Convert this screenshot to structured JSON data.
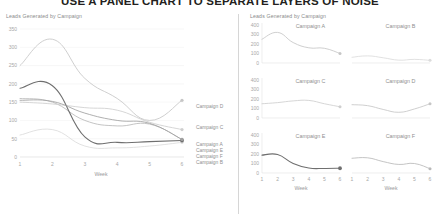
{
  "slide": {
    "title": "USE A PANEL CHART TO SEPARATE LAYERS OF NOISE"
  },
  "left": {
    "subtitle": "Leads Generated by Campaign",
    "xaxis_name": "Week",
    "yticks": [
      "0",
      "50",
      "100",
      "150",
      "200",
      "250",
      "300",
      "350"
    ],
    "xticks": [
      "1",
      "2",
      "3",
      "4",
      "5",
      "6"
    ],
    "legend": [
      {
        "label": "Campaign D"
      },
      {
        "label": "Campaign C"
      },
      {
        "label": "Campaign A"
      },
      {
        "label": "Campaign E"
      },
      {
        "label": "Campaign F"
      },
      {
        "label": "Campaign B"
      }
    ]
  },
  "right": {
    "subtitle": "Leads Generated by Campaign",
    "xaxis_name": "Week",
    "yticks": [
      "0",
      "100",
      "200",
      "300",
      "400"
    ],
    "xticks": [
      "1",
      "2",
      "3",
      "4",
      "5",
      "6"
    ],
    "panels": [
      {
        "label": "Campaign A"
      },
      {
        "label": "Campaign B"
      },
      {
        "label": "Campaign C"
      },
      {
        "label": "Campaign D"
      },
      {
        "label": "Campaign E"
      },
      {
        "label": "Campaign F"
      }
    ]
  },
  "chart_data": {
    "type": "line",
    "title": "Leads Generated by Campaign",
    "xlabel": "Week",
    "ylabel": "",
    "x": [
      1,
      2,
      3,
      4,
      5,
      6
    ],
    "xlim": [
      1,
      6
    ],
    "grid": false,
    "legend_position": "right",
    "overview": {
      "ylim": [
        0,
        350
      ],
      "yticks": [
        0,
        50,
        100,
        150,
        200,
        250,
        300,
        350
      ],
      "series": [
        {
          "name": "Campaign A",
          "values": [
            160,
            150,
            100,
            85,
            90,
            48
          ],
          "color": "#b9b9b9",
          "highlight": false
        },
        {
          "name": "Campaign B",
          "values": [
            60,
            75,
            30,
            25,
            30,
            40
          ],
          "color": "#dcdcdc",
          "highlight": false
        },
        {
          "name": "Campaign C",
          "values": [
            150,
            145,
            135,
            128,
            95,
            75
          ],
          "color": "#cfcfcf",
          "highlight": false
        },
        {
          "name": "Campaign D",
          "values": [
            250,
            322,
            215,
            160,
            100,
            155
          ],
          "color": "#c6c6c6",
          "highlight": false
        },
        {
          "name": "Campaign E",
          "values": [
            188,
            195,
            55,
            40,
            42,
            45
          ],
          "color": "#6f6f6f",
          "highlight": true
        },
        {
          "name": "Campaign F",
          "values": [
            155,
            152,
            120,
            100,
            92,
            48
          ],
          "color": "#a0a0a0",
          "highlight": false
        }
      ]
    },
    "panels": {
      "ylim": [
        0,
        400
      ],
      "yticks": [
        0,
        100,
        200,
        300,
        400
      ],
      "layout": "3 rows x 2 columns",
      "items": [
        {
          "name": "Campaign A",
          "values": [
            250,
            322,
            215,
            160,
            155,
            100
          ],
          "color": "#c6c6c6",
          "highlight": false
        },
        {
          "name": "Campaign B",
          "values": [
            60,
            75,
            55,
            30,
            38,
            28
          ],
          "color": "#dcdcdc",
          "highlight": false
        },
        {
          "name": "Campaign C",
          "values": [
            150,
            162,
            180,
            185,
            150,
            118
          ],
          "color": "#cfcfcf",
          "highlight": false
        },
        {
          "name": "Campaign D",
          "values": [
            140,
            130,
            90,
            60,
            95,
            150
          ],
          "color": "#c6c6c6",
          "highlight": false
        },
        {
          "name": "Campaign E",
          "values": [
            188,
            195,
            100,
            52,
            48,
            50
          ],
          "color": "#6f6f6f",
          "highlight": true
        },
        {
          "name": "Campaign F",
          "values": [
            155,
            160,
            120,
            90,
            100,
            45
          ],
          "color": "#b9b9b9",
          "highlight": false
        }
      ]
    }
  }
}
